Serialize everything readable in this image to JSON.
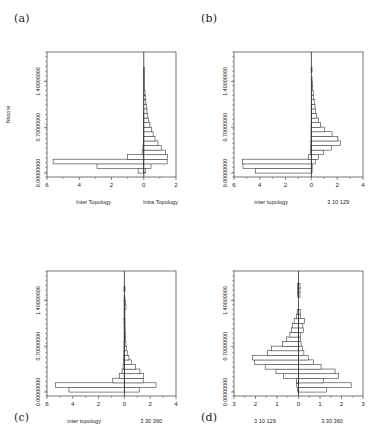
{
  "figure": {
    "panel_tags": {
      "a": "(a)",
      "b": "(b)",
      "c": "(c)",
      "d": "(d)"
    }
  },
  "chart_data": [
    {
      "id": "a",
      "type": "bar",
      "orientation": "horizontal",
      "style": "back-to-back-pyramid",
      "title": "",
      "xlabel_left": "Inter Topology",
      "xlabel_right": "Intra Topology",
      "ylabel": "Nscore",
      "xticks": [
        -6,
        -4,
        -2,
        0,
        2
      ],
      "xticklabels": [
        "6",
        "4",
        "2",
        "0",
        "2"
      ],
      "xlim": [
        -6,
        2
      ],
      "yticks": [
        0.0,
        0.7,
        1.4
      ],
      "yticklabels": [
        "0.00000000",
        "0.70000000",
        "1.40000000"
      ],
      "ylim": [
        -0.06,
        1.85
      ],
      "grid": false,
      "legend": false,
      "bins": [
        {
          "y": 0.0,
          "left": 0.35,
          "right": 0.1
        },
        {
          "y": 0.07,
          "left": 2.9,
          "right": 0.45
        },
        {
          "y": 0.14,
          "left": 5.62,
          "right": 1.45
        },
        {
          "y": 0.21,
          "left": 1.0,
          "right": 1.48
        },
        {
          "y": 0.28,
          "left": 0.1,
          "right": 1.35
        },
        {
          "y": 0.35,
          "left": 0.05,
          "right": 1.08
        },
        {
          "y": 0.42,
          "left": 0.03,
          "right": 0.88
        },
        {
          "y": 0.49,
          "left": 0.02,
          "right": 0.7
        },
        {
          "y": 0.56,
          "left": 0.02,
          "right": 0.58
        },
        {
          "y": 0.63,
          "left": 0.01,
          "right": 0.47
        },
        {
          "y": 0.7,
          "left": 0.01,
          "right": 0.38
        },
        {
          "y": 0.77,
          "left": 0.01,
          "right": 0.3
        },
        {
          "y": 0.84,
          "left": 0.01,
          "right": 0.25
        },
        {
          "y": 0.91,
          "left": 0.0,
          "right": 0.2
        },
        {
          "y": 0.98,
          "left": 0.0,
          "right": 0.16
        },
        {
          "y": 1.05,
          "left": 0.0,
          "right": 0.13
        },
        {
          "y": 1.12,
          "left": 0.0,
          "right": 0.1
        },
        {
          "y": 1.19,
          "left": 0.0,
          "right": 0.08
        },
        {
          "y": 1.26,
          "left": 0.0,
          "right": 0.06
        },
        {
          "y": 1.33,
          "left": 0.0,
          "right": 0.05
        },
        {
          "y": 1.4,
          "left": 0.0,
          "right": 0.04
        },
        {
          "y": 1.47,
          "left": 0.0,
          "right": 0.03
        },
        {
          "y": 1.54,
          "left": 0.0,
          "right": 0.02
        }
      ]
    },
    {
      "id": "b",
      "type": "bar",
      "orientation": "horizontal",
      "style": "back-to-back-pyramid",
      "title": "",
      "xlabel_left": "inter topology",
      "xlabel_right": "3 10 129",
      "ylabel": "",
      "xticks": [
        -6,
        -4,
        -2,
        0,
        2,
        4
      ],
      "xticklabels": [
        "6",
        "4",
        "2",
        "0",
        "2",
        "4"
      ],
      "xlim": [
        -6,
        4
      ],
      "yticks": [
        0.0,
        0.7,
        1.4
      ],
      "yticklabels": [
        "0.00000000",
        "0.70000000",
        "1.40000000"
      ],
      "ylim": [
        -0.06,
        1.85
      ],
      "grid": false,
      "legend": false,
      "bins": [
        {
          "y": 0.0,
          "left": 4.35,
          "right": 0.05
        },
        {
          "y": 0.07,
          "left": 5.3,
          "right": 0.06
        },
        {
          "y": 0.14,
          "left": 5.35,
          "right": 0.3
        },
        {
          "y": 0.21,
          "left": 0.22,
          "right": 0.55
        },
        {
          "y": 0.28,
          "left": 0.08,
          "right": 0.95
        },
        {
          "y": 0.35,
          "left": 0.05,
          "right": 1.55
        },
        {
          "y": 0.42,
          "left": 0.04,
          "right": 2.25
        },
        {
          "y": 0.49,
          "left": 0.03,
          "right": 2.05
        },
        {
          "y": 0.56,
          "left": 0.03,
          "right": 1.6
        },
        {
          "y": 0.63,
          "left": 0.02,
          "right": 1.0
        },
        {
          "y": 0.7,
          "left": 0.02,
          "right": 0.72
        },
        {
          "y": 0.77,
          "left": 0.01,
          "right": 0.55
        },
        {
          "y": 0.84,
          "left": 0.01,
          "right": 0.42
        },
        {
          "y": 0.91,
          "left": 0.01,
          "right": 0.33
        },
        {
          "y": 0.98,
          "left": 0.01,
          "right": 0.28
        },
        {
          "y": 1.05,
          "left": 0.0,
          "right": 0.22
        },
        {
          "y": 1.12,
          "left": 0.0,
          "right": 0.18
        },
        {
          "y": 1.19,
          "left": 0.0,
          "right": 0.14
        },
        {
          "y": 1.26,
          "left": 0.0,
          "right": 0.1
        },
        {
          "y": 1.33,
          "left": 0.0,
          "right": 0.07
        },
        {
          "y": 1.4,
          "left": 0.0,
          "right": 0.05
        },
        {
          "y": 1.54,
          "left": 0.02,
          "right": 0.05
        }
      ]
    },
    {
      "id": "c",
      "type": "bar",
      "orientation": "horizontal",
      "style": "back-to-back-pyramid",
      "title": "",
      "xlabel_left": "inter topology",
      "xlabel_right": "3 30 360",
      "ylabel": "",
      "xticks": [
        -6,
        -4,
        -2,
        0,
        2,
        4
      ],
      "xticklabels": [
        "6",
        "4",
        "2",
        "0",
        "2",
        "4"
      ],
      "xlim": [
        -6,
        4
      ],
      "yticks": [
        0.0,
        0.7,
        1.4
      ],
      "yticklabels": [
        "0.00000000",
        "0.70000000",
        "1.40000000"
      ],
      "ylim": [
        -0.06,
        1.85
      ],
      "grid": false,
      "legend": false,
      "bins": [
        {
          "y": 0.0,
          "left": 4.3,
          "right": 1.15
        },
        {
          "y": 0.07,
          "left": 5.35,
          "right": 2.45
        },
        {
          "y": 0.14,
          "left": 0.9,
          "right": 1.45
        },
        {
          "y": 0.21,
          "left": 0.4,
          "right": 1.5
        },
        {
          "y": 0.28,
          "left": 0.18,
          "right": 1.2
        },
        {
          "y": 0.35,
          "left": 0.1,
          "right": 0.85
        },
        {
          "y": 0.42,
          "left": 0.07,
          "right": 0.55
        },
        {
          "y": 0.49,
          "left": 0.05,
          "right": 0.35
        },
        {
          "y": 0.56,
          "left": 0.04,
          "right": 0.22
        },
        {
          "y": 0.63,
          "left": 0.03,
          "right": 0.16
        },
        {
          "y": 0.7,
          "left": 0.03,
          "right": 0.12
        },
        {
          "y": 0.77,
          "left": 0.02,
          "right": 0.09
        },
        {
          "y": 0.84,
          "left": 0.02,
          "right": 0.07
        },
        {
          "y": 0.91,
          "left": 0.02,
          "right": 0.06
        },
        {
          "y": 0.98,
          "left": 0.02,
          "right": 0.05
        },
        {
          "y": 1.05,
          "left": 0.03,
          "right": 0.05
        },
        {
          "y": 1.12,
          "left": 0.02,
          "right": 0.04
        },
        {
          "y": 1.19,
          "left": 0.02,
          "right": 0.04
        },
        {
          "y": 1.26,
          "left": 0.02,
          "right": 0.12
        },
        {
          "y": 1.33,
          "left": 0.02,
          "right": 0.1
        },
        {
          "y": 1.4,
          "left": 0.02,
          "right": 0.04
        },
        {
          "y": 1.54,
          "left": 0.03,
          "right": 0.05
        }
      ]
    },
    {
      "id": "d",
      "type": "bar",
      "orientation": "horizontal",
      "style": "back-to-back-pyramid",
      "title": "",
      "xlabel_left": "3 10 129",
      "xlabel_right": "3 30 360",
      "ylabel": "",
      "xticks": [
        -3,
        -2,
        -1,
        0,
        1,
        2,
        3
      ],
      "xticklabels": [
        "3",
        "2",
        "1",
        "0",
        "1",
        "2",
        "3"
      ],
      "xlim": [
        -3,
        3
      ],
      "yticks": [
        0.0,
        0.7,
        1.4
      ],
      "yticklabels": [
        "0.00000000",
        "0.70000000",
        "1.40000000"
      ],
      "ylim": [
        -0.06,
        1.85
      ],
      "grid": false,
      "legend": false,
      "bins": [
        {
          "y": 0.0,
          "left": 0.05,
          "right": 1.3
        },
        {
          "y": 0.07,
          "left": 0.08,
          "right": 2.45
        },
        {
          "y": 0.14,
          "left": 0.1,
          "right": 1.15
        },
        {
          "y": 0.21,
          "left": 0.7,
          "right": 1.85
        },
        {
          "y": 0.28,
          "left": 1.05,
          "right": 1.7
        },
        {
          "y": 0.35,
          "left": 1.55,
          "right": 1.05
        },
        {
          "y": 0.42,
          "left": 2.05,
          "right": 0.7
        },
        {
          "y": 0.49,
          "left": 2.15,
          "right": 0.45
        },
        {
          "y": 0.56,
          "left": 1.45,
          "right": 0.25
        },
        {
          "y": 0.63,
          "left": 1.25,
          "right": 0.18
        },
        {
          "y": 0.7,
          "left": 0.75,
          "right": 0.12
        },
        {
          "y": 0.77,
          "left": 0.55,
          "right": 0.1
        },
        {
          "y": 0.84,
          "left": 0.4,
          "right": 0.08
        },
        {
          "y": 0.91,
          "left": 0.32,
          "right": 0.22
        },
        {
          "y": 0.98,
          "left": 0.28,
          "right": 0.2
        },
        {
          "y": 1.05,
          "left": 0.2,
          "right": 0.28
        },
        {
          "y": 1.12,
          "left": 0.1,
          "right": 0.1
        },
        {
          "y": 1.19,
          "left": 0.06,
          "right": 0.08
        },
        {
          "y": 1.45,
          "left": 0.05,
          "right": 0.07
        },
        {
          "y": 1.52,
          "left": 0.05,
          "right": 0.07
        },
        {
          "y": 1.59,
          "left": 0.05,
          "right": 0.07
        }
      ]
    }
  ]
}
